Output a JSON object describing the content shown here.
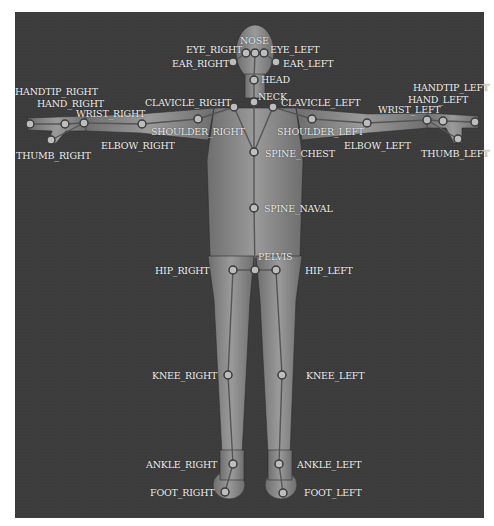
{
  "diagram": {
    "colors": {
      "background": "#3c3c3c",
      "body": "#8a8a8a",
      "bone": "#5a5a5a",
      "joint_fill": "#bdbdbd",
      "joint_ring": "#3a3a3a",
      "label": "#f0f0f0"
    },
    "joints": [
      {
        "name": "NOSE",
        "x": 255,
        "y": 53,
        "label": "NOSE",
        "lx": 240,
        "ly": 36
      },
      {
        "name": "EYE_RIGHT",
        "x": 246,
        "y": 53,
        "label": "EYE_RIGHT",
        "lx": 186,
        "ly": 45
      },
      {
        "name": "EYE_LEFT",
        "x": 264,
        "y": 53,
        "label": "EYE_LEFT",
        "lx": 270,
        "ly": 45
      },
      {
        "name": "EAR_RIGHT",
        "x": 233,
        "y": 62,
        "label": "EAR_RIGHT",
        "lx": 172,
        "ly": 59
      },
      {
        "name": "EAR_LEFT",
        "x": 276,
        "y": 62,
        "label": "EAR_LEFT",
        "lx": 283,
        "ly": 59
      },
      {
        "name": "HEAD",
        "x": 254,
        "y": 80,
        "label": "HEAD",
        "lx": 261,
        "ly": 75
      },
      {
        "name": "NECK",
        "x": 254,
        "y": 102,
        "label": "NECK",
        "lx": 258,
        "ly": 92
      },
      {
        "name": "CLAVICLE_RIGHT",
        "x": 234,
        "y": 107,
        "label": "CLAVICLE_RIGHT",
        "lx": 145,
        "ly": 98
      },
      {
        "name": "CLAVICLE_LEFT",
        "x": 273,
        "y": 107,
        "label": "CLAVICLE_LEFT",
        "lx": 281,
        "ly": 98
      },
      {
        "name": "SHOULDER_RIGHT",
        "x": 198,
        "y": 119,
        "label": "SHOULDER_RIGHT",
        "lx": 151,
        "ly": 127
      },
      {
        "name": "SHOULDER_LEFT",
        "x": 312,
        "y": 119,
        "label": "SHOULDER_LEFT",
        "lx": 277,
        "ly": 127
      },
      {
        "name": "ELBOW_RIGHT",
        "x": 142,
        "y": 124,
        "label": "ELBOW_RIGHT",
        "lx": 101,
        "ly": 141
      },
      {
        "name": "ELBOW_LEFT",
        "x": 367,
        "y": 123,
        "label": "ELBOW_LEFT",
        "lx": 344,
        "ly": 141
      },
      {
        "name": "WRIST_RIGHT",
        "x": 84,
        "y": 123,
        "label": "WRIST_RIGHT",
        "lx": 76,
        "ly": 109
      },
      {
        "name": "WRIST_LEFT",
        "x": 427,
        "y": 120,
        "label": "WRIST_LEFT",
        "lx": 378,
        "ly": 105
      },
      {
        "name": "HAND_RIGHT",
        "x": 65,
        "y": 124,
        "label": "HAND_RIGHT",
        "lx": 37,
        "ly": 99
      },
      {
        "name": "HAND_LEFT",
        "x": 443,
        "y": 121,
        "label": "HAND_LEFT",
        "lx": 408,
        "ly": 95
      },
      {
        "name": "HANDTIP_RIGHT",
        "x": 30,
        "y": 124,
        "label": "HANDTIP_RIGHT",
        "lx": 15,
        "ly": 87
      },
      {
        "name": "HANDTIP_LEFT",
        "x": 475,
        "y": 122,
        "label": "HANDTIP_LEFT",
        "lx": 413,
        "ly": 83
      },
      {
        "name": "THUMB_RIGHT",
        "x": 51,
        "y": 140,
        "label": "THUMB_RIGHT",
        "lx": 16,
        "ly": 151
      },
      {
        "name": "THUMB_LEFT",
        "x": 458,
        "y": 139,
        "label": "THUMB_LEFT",
        "lx": 421,
        "ly": 149
      },
      {
        "name": "SPINE_CHEST",
        "x": 254,
        "y": 152,
        "label": "SPINE_CHEST",
        "lx": 265,
        "ly": 149
      },
      {
        "name": "SPINE_NAVAL",
        "x": 254,
        "y": 208,
        "label": "SPINE_NAVAL",
        "lx": 264,
        "ly": 204
      },
      {
        "name": "PELVIS",
        "x": 255,
        "y": 270,
        "label": "PELVIS",
        "lx": 258,
        "ly": 252
      },
      {
        "name": "HIP_RIGHT",
        "x": 233,
        "y": 270,
        "label": "HIP_RIGHT",
        "lx": 155,
        "ly": 266
      },
      {
        "name": "HIP_LEFT",
        "x": 276,
        "y": 270,
        "label": "HIP_LEFT",
        "lx": 305,
        "ly": 266
      },
      {
        "name": "KNEE_RIGHT",
        "x": 228,
        "y": 375,
        "label": "KNEE_RIGHT",
        "lx": 152,
        "ly": 371
      },
      {
        "name": "KNEE_LEFT",
        "x": 282,
        "y": 375,
        "label": "KNEE_LEFT",
        "lx": 306,
        "ly": 371
      },
      {
        "name": "ANKLE_RIGHT",
        "x": 233,
        "y": 464,
        "label": "ANKLE_RIGHT",
        "lx": 146,
        "ly": 460
      },
      {
        "name": "ANKLE_LEFT",
        "x": 279,
        "y": 464,
        "label": "ANKLE_LEFT",
        "lx": 297,
        "ly": 460
      },
      {
        "name": "FOOT_RIGHT",
        "x": 225,
        "y": 492,
        "label": "FOOT_RIGHT",
        "lx": 150,
        "ly": 488
      },
      {
        "name": "FOOT_LEFT",
        "x": 283,
        "y": 493,
        "label": "FOOT_LEFT",
        "lx": 304,
        "ly": 488
      }
    ],
    "bones": [
      [
        "PELVIS",
        "SPINE_NAVAL"
      ],
      [
        "SPINE_NAVAL",
        "SPINE_CHEST"
      ],
      [
        "SPINE_CHEST",
        "NECK"
      ],
      [
        "NECK",
        "HEAD"
      ],
      [
        "HEAD",
        "NOSE"
      ],
      [
        "NOSE",
        "EYE_RIGHT"
      ],
      [
        "NOSE",
        "EYE_LEFT"
      ],
      [
        "EYE_RIGHT",
        "EAR_RIGHT"
      ],
      [
        "EYE_LEFT",
        "EAR_LEFT"
      ],
      [
        "SPINE_CHEST",
        "CLAVICLE_RIGHT"
      ],
      [
        "SPINE_CHEST",
        "CLAVICLE_LEFT"
      ],
      [
        "CLAVICLE_RIGHT",
        "SHOULDER_RIGHT"
      ],
      [
        "SHOULDER_RIGHT",
        "ELBOW_RIGHT"
      ],
      [
        "ELBOW_RIGHT",
        "WRIST_RIGHT"
      ],
      [
        "WRIST_RIGHT",
        "HAND_RIGHT"
      ],
      [
        "HAND_RIGHT",
        "HANDTIP_RIGHT"
      ],
      [
        "WRIST_RIGHT",
        "THUMB_RIGHT"
      ],
      [
        "CLAVICLE_LEFT",
        "SHOULDER_LEFT"
      ],
      [
        "SHOULDER_LEFT",
        "ELBOW_LEFT"
      ],
      [
        "ELBOW_LEFT",
        "WRIST_LEFT"
      ],
      [
        "WRIST_LEFT",
        "HAND_LEFT"
      ],
      [
        "HAND_LEFT",
        "HANDTIP_LEFT"
      ],
      [
        "WRIST_LEFT",
        "THUMB_LEFT"
      ],
      [
        "PELVIS",
        "HIP_RIGHT"
      ],
      [
        "HIP_RIGHT",
        "KNEE_RIGHT"
      ],
      [
        "KNEE_RIGHT",
        "ANKLE_RIGHT"
      ],
      [
        "ANKLE_RIGHT",
        "FOOT_RIGHT"
      ],
      [
        "PELVIS",
        "HIP_LEFT"
      ],
      [
        "HIP_LEFT",
        "KNEE_LEFT"
      ],
      [
        "KNEE_LEFT",
        "ANKLE_LEFT"
      ],
      [
        "ANKLE_LEFT",
        "FOOT_LEFT"
      ]
    ]
  }
}
